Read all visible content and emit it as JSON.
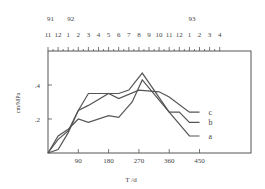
{
  "chart_data": {
    "type": "line",
    "title": "",
    "xlabel": "T /d",
    "ylabel": "cm/MPa",
    "xlim": [
      0,
      605
    ],
    "ylim": [
      0,
      0.6
    ],
    "x_ticks": [
      90,
      180,
      270,
      360,
      450
    ],
    "x_tick_labels": [
      "90",
      "180",
      "270",
      "360",
      "450"
    ],
    "y_ticks": [
      0.2,
      0.4
    ],
    "y_tick_labels": [
      ".2",
      ".4"
    ],
    "top_axis": {
      "year_labels": [
        {
          "label": "91",
          "month_index": 0
        },
        {
          "label": "92",
          "month_index": 2
        },
        {
          "label": "93",
          "month_index": 14
        }
      ],
      "month_labels": [
        "11",
        "12",
        "1",
        "2",
        "3",
        "4",
        "5",
        "6",
        "7",
        "8",
        "9",
        "10",
        "11",
        "12",
        "1",
        "2",
        "3",
        "4"
      ]
    },
    "grid": false,
    "legend_position": "inline-right",
    "series": [
      {
        "name": "a",
        "x": [
          0,
          30,
          60,
          90,
          120,
          180,
          210,
          240,
          280,
          360,
          420,
          450
        ],
        "y": [
          0,
          0.02,
          0.12,
          0.25,
          0.35,
          0.35,
          0.35,
          0.37,
          0.47,
          0.24,
          0.1,
          0.1
        ]
      },
      {
        "name": "b",
        "x": [
          0,
          30,
          60,
          90,
          120,
          180,
          210,
          250,
          280,
          360,
          390,
          420,
          450
        ],
        "y": [
          0,
          0.1,
          0.14,
          0.2,
          0.18,
          0.22,
          0.21,
          0.3,
          0.43,
          0.24,
          0.24,
          0.18,
          0.18
        ]
      },
      {
        "name": "c",
        "x": [
          0,
          30,
          60,
          90,
          120,
          180,
          210,
          270,
          330,
          360,
          420,
          450
        ],
        "y": [
          0,
          0.08,
          0.13,
          0.25,
          0.28,
          0.35,
          0.32,
          0.37,
          0.36,
          0.33,
          0.24,
          0.24
        ]
      }
    ]
  }
}
